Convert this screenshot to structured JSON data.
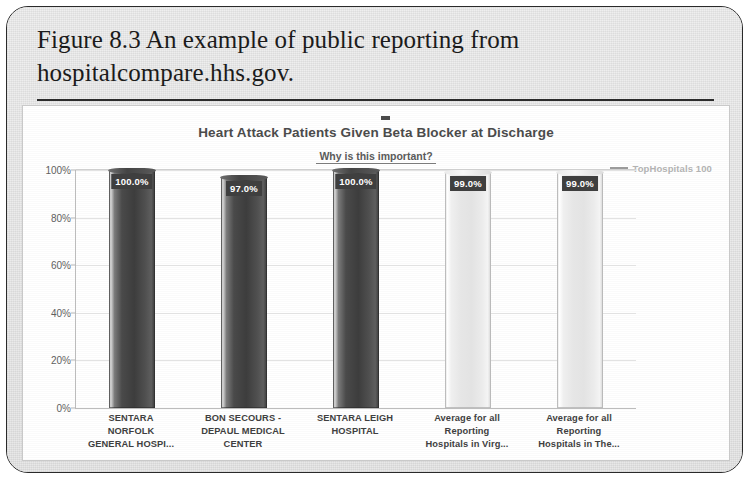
{
  "figure": {
    "caption_line1": "Figure 8.3  An example of public reporting from",
    "caption_line2": "hospitalcompare.hhs.gov."
  },
  "chart_panel": {
    "title": "Heart Attack Patients Given Beta Blocker at Discharge",
    "sublink": "Why is this important?",
    "legend_label": "TopHospitals 100"
  },
  "chart_data": {
    "type": "bar",
    "title": "Heart Attack Patients Given Beta Blocker at Discharge",
    "xlabel": "",
    "ylabel": "",
    "ylim": [
      0,
      100
    ],
    "grid": true,
    "legend_position": "top-right",
    "ytick_labels": [
      "100%",
      "80%",
      "60%",
      "40%",
      "20%",
      "0%"
    ],
    "ytick_values": [
      100,
      80,
      60,
      40,
      20,
      0
    ],
    "categories": [
      "SENTARA NORFOLK GENERAL HOSPI...",
      "BON SECOURS - DEPAUL MEDICAL CENTER",
      "SENTARA LEIGH HOSPITAL",
      "Average for all Reporting Hospitals in Virg...",
      "Average for all Reporting Hospitals in The..."
    ],
    "values": [
      100.0,
      97.0,
      100.0,
      99.0,
      99.0
    ],
    "value_labels": [
      "100.0%",
      "97.0%",
      "100.0%",
      "99.0%",
      "99.0%"
    ],
    "bar_styles": [
      "dark",
      "dark",
      "dark",
      "light",
      "light"
    ]
  },
  "x_axis_labels": [
    {
      "lines": [
        "SENTARA",
        "NORFOLK",
        "GENERAL HOSPI..."
      ]
    },
    {
      "lines": [
        "BON SECOURS -",
        "DEPAUL MEDICAL",
        "CENTER"
      ]
    },
    {
      "lines": [
        "SENTARA LEIGH",
        "HOSPITAL"
      ]
    },
    {
      "lines": [
        "Average for all",
        "Reporting",
        "Hospitals in Virg..."
      ]
    },
    {
      "lines": [
        "Average for all",
        "Reporting",
        "Hospitals in The..."
      ]
    }
  ],
  "colors": {
    "bar_dark": "#3d3d3d",
    "bar_light": "#e6e6e6",
    "value_badge": "#3f3f3f",
    "title_text": "#4b4b4b",
    "legend_text": "#b3b3b3",
    "frame_border": "#2a2a2a"
  }
}
